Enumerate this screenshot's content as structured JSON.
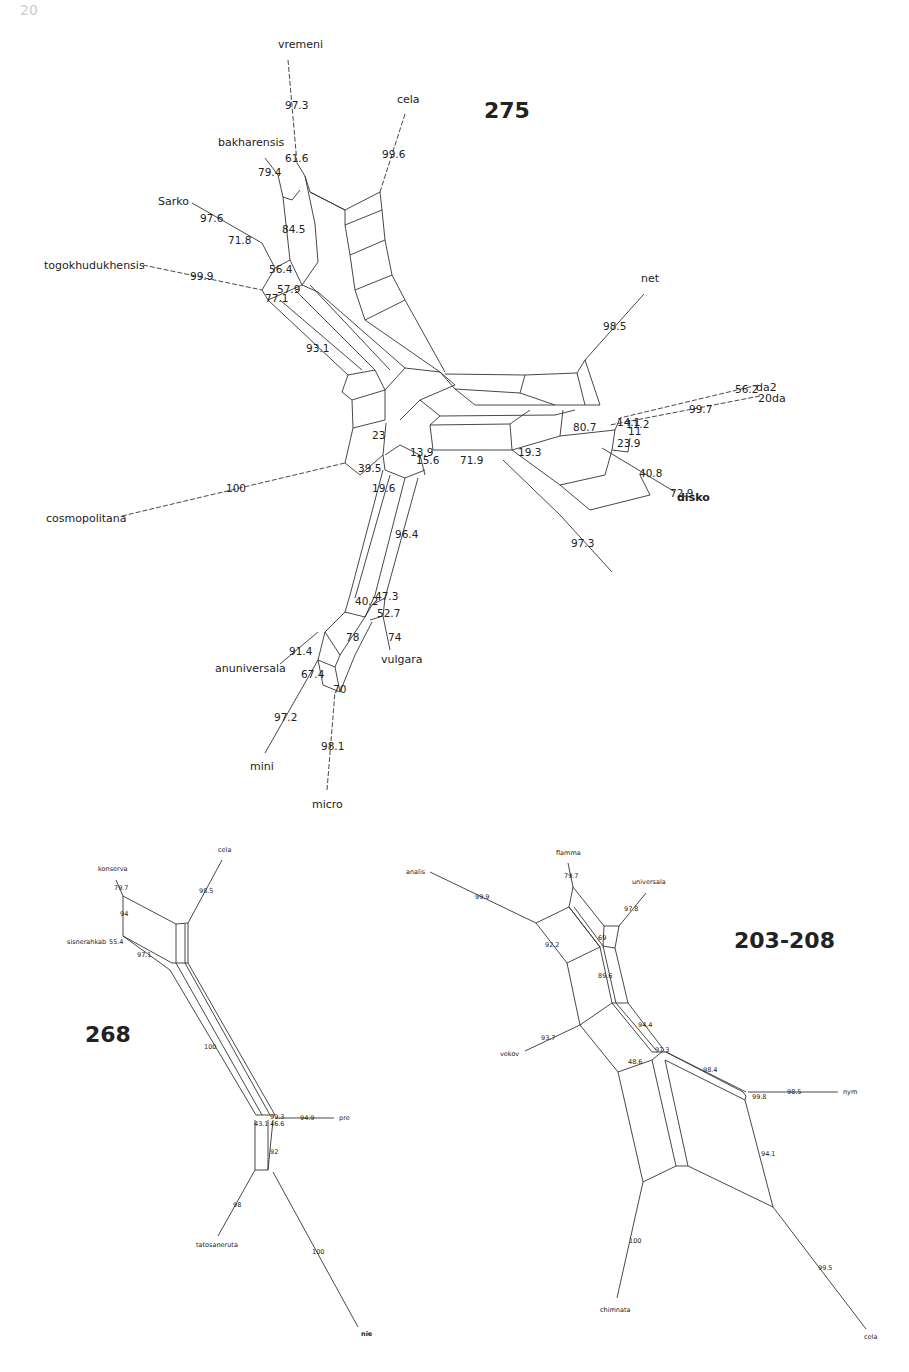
{
  "page": {
    "number": "20"
  },
  "diagrams": [
    {
      "id": "275",
      "title": "275",
      "taxa": [
        {
          "name": "vremeni",
          "x": 278,
          "y": 48
        },
        {
          "name": "cela",
          "x": 397,
          "y": 103
        },
        {
          "name": "bakharensis",
          "x": 218,
          "y": 146
        },
        {
          "name": "Sarko",
          "x": 158,
          "y": 205
        },
        {
          "name": "togokhudukhensis",
          "x": 44,
          "y": 269
        },
        {
          "name": "net",
          "x": 641,
          "y": 282
        },
        {
          "name": "da2",
          "x": 756,
          "y": 391
        },
        {
          "name": "20da",
          "x": 758,
          "y": 402
        },
        {
          "name": "disko",
          "x": 677,
          "y": 501
        },
        {
          "name": "cosmopolitana",
          "x": 46,
          "y": 522
        },
        {
          "name": "anuniversala",
          "x": 215,
          "y": 672
        },
        {
          "name": "vulgara",
          "x": 381,
          "y": 663
        },
        {
          "name": "mini",
          "x": 250,
          "y": 770
        },
        {
          "name": "micro",
          "x": 312,
          "y": 808
        }
      ],
      "support_values": [
        {
          "v": "97.3",
          "x": 285,
          "y": 109
        },
        {
          "v": "99.6",
          "x": 382,
          "y": 158
        },
        {
          "v": "61.6",
          "x": 285,
          "y": 162
        },
        {
          "v": "79.4",
          "x": 258,
          "y": 176
        },
        {
          "v": "97.6",
          "x": 200,
          "y": 222
        },
        {
          "v": "71.8",
          "x": 228,
          "y": 244
        },
        {
          "v": "84.5",
          "x": 282,
          "y": 233
        },
        {
          "v": "56.4",
          "x": 269,
          "y": 273
        },
        {
          "v": "99.9",
          "x": 190,
          "y": 280
        },
        {
          "v": "57.9",
          "x": 277,
          "y": 293
        },
        {
          "v": "77.1",
          "x": 265,
          "y": 302
        },
        {
          "v": "93.1",
          "x": 306,
          "y": 352
        },
        {
          "v": "98.5",
          "x": 603,
          "y": 330
        },
        {
          "v": "56.2",
          "x": 735,
          "y": 393
        },
        {
          "v": "99.7",
          "x": 689,
          "y": 413
        },
        {
          "v": "80.7",
          "x": 573,
          "y": 431
        },
        {
          "v": "14.1",
          "x": 617,
          "y": 426
        },
        {
          "v": "11.2",
          "x": 626,
          "y": 428
        },
        {
          "v": "11",
          "x": 628,
          "y": 435
        },
        {
          "v": "23.9",
          "x": 617,
          "y": 447
        },
        {
          "v": "40.8",
          "x": 639,
          "y": 477
        },
        {
          "v": "72.9",
          "x": 670,
          "y": 497
        },
        {
          "v": "23",
          "x": 372,
          "y": 439
        },
        {
          "v": "13.9",
          "x": 410,
          "y": 456
        },
        {
          "v": "15.6",
          "x": 416,
          "y": 464
        },
        {
          "v": "71.9",
          "x": 460,
          "y": 464
        },
        {
          "v": "19.3",
          "x": 518,
          "y": 456
        },
        {
          "v": "39.5",
          "x": 358,
          "y": 472
        },
        {
          "v": "19.6",
          "x": 372,
          "y": 492
        },
        {
          "v": "100",
          "x": 226,
          "y": 492
        },
        {
          "v": "96.4",
          "x": 395,
          "y": 538
        },
        {
          "v": "97.3",
          "x": 571,
          "y": 547
        },
        {
          "v": "40.2",
          "x": 355,
          "y": 605
        },
        {
          "v": "47.3",
          "x": 375,
          "y": 600
        },
        {
          "v": "52.7",
          "x": 377,
          "y": 617
        },
        {
          "v": "78",
          "x": 346,
          "y": 641
        },
        {
          "v": "74",
          "x": 388,
          "y": 641
        },
        {
          "v": "91.4",
          "x": 289,
          "y": 655
        },
        {
          "v": "67.4",
          "x": 301,
          "y": 678
        },
        {
          "v": "70",
          "x": 333,
          "y": 693
        },
        {
          "v": "97.2",
          "x": 274,
          "y": 721
        },
        {
          "v": "98.1",
          "x": 321,
          "y": 750
        }
      ]
    },
    {
      "id": "268",
      "title": "268",
      "taxa": [
        {
          "name": "cela",
          "x": 218,
          "y": 852
        },
        {
          "name": "konserva",
          "x": 98,
          "y": 871
        },
        {
          "name": "sisnerahkab",
          "x": 67,
          "y": 944
        },
        {
          "name": "pre",
          "x": 339,
          "y": 1120
        },
        {
          "name": "tatosaneruta",
          "x": 196,
          "y": 1247
        },
        {
          "name": "nie",
          "x": 361,
          "y": 1336
        }
      ],
      "support_values": [
        {
          "v": "98.5",
          "x": 199,
          "y": 893
        },
        {
          "v": "79.7",
          "x": 114,
          "y": 890
        },
        {
          "v": "94",
          "x": 120,
          "y": 916
        },
        {
          "v": "55.4",
          "x": 109,
          "y": 944
        },
        {
          "v": "97.1",
          "x": 137,
          "y": 957
        },
        {
          "v": "100",
          "x": 204,
          "y": 1049
        },
        {
          "v": "99.3",
          "x": 270,
          "y": 1119
        },
        {
          "v": "94.9",
          "x": 300,
          "y": 1120
        },
        {
          "v": "43.1",
          "x": 254,
          "y": 1126
        },
        {
          "v": "46.6",
          "x": 270,
          "y": 1126
        },
        {
          "v": "92",
          "x": 270,
          "y": 1154
        },
        {
          "v": "98",
          "x": 233,
          "y": 1207
        },
        {
          "v": "100",
          "x": 312,
          "y": 1254
        }
      ]
    },
    {
      "id": "203-208",
      "title": "203-208",
      "taxa": [
        {
          "name": "flamma",
          "x": 556,
          "y": 855
        },
        {
          "name": "analis",
          "x": 406,
          "y": 874
        },
        {
          "name": "universala",
          "x": 632,
          "y": 884
        },
        {
          "name": "vekov",
          "x": 500,
          "y": 1056
        },
        {
          "name": "nym",
          "x": 843,
          "y": 1094
        },
        {
          "name": "chimnata",
          "x": 600,
          "y": 1312
        },
        {
          "name": "cela",
          "x": 864,
          "y": 1339
        }
      ],
      "support_values": [
        {
          "v": "79.7",
          "x": 564,
          "y": 878
        },
        {
          "v": "99.9",
          "x": 475,
          "y": 899
        },
        {
          "v": "97.8",
          "x": 624,
          "y": 911
        },
        {
          "v": "69",
          "x": 598,
          "y": 940
        },
        {
          "v": "92.2",
          "x": 545,
          "y": 947
        },
        {
          "v": "89.6",
          "x": 598,
          "y": 978
        },
        {
          "v": "94.4",
          "x": 638,
          "y": 1027
        },
        {
          "v": "93.7",
          "x": 541,
          "y": 1040
        },
        {
          "v": "97.3",
          "x": 655,
          "y": 1052
        },
        {
          "v": "48.6",
          "x": 628,
          "y": 1064
        },
        {
          "v": "98.4",
          "x": 703,
          "y": 1072
        },
        {
          "v": "98.5",
          "x": 787,
          "y": 1094
        },
        {
          "v": "99.8",
          "x": 752,
          "y": 1099
        },
        {
          "v": "94.1",
          "x": 761,
          "y": 1156
        },
        {
          "v": "100",
          "x": 629,
          "y": 1243
        },
        {
          "v": "99.5",
          "x": 818,
          "y": 1270
        }
      ]
    }
  ]
}
